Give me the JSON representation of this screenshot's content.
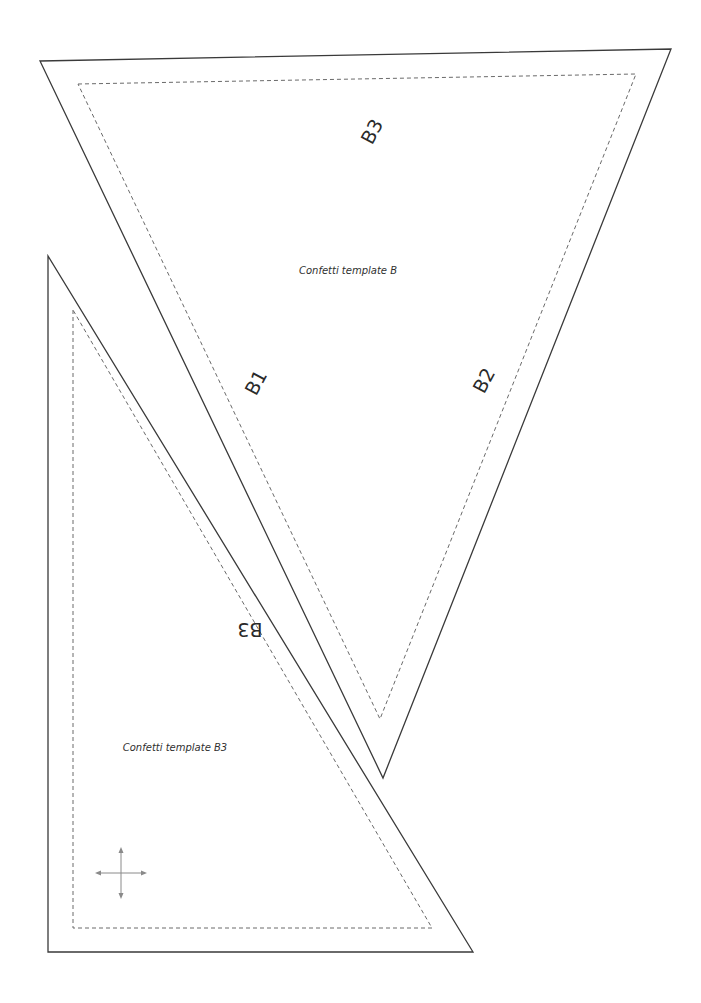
{
  "document": {
    "type": "sewing-template-sheet",
    "colors": {
      "cut_line": "#3a3a3a",
      "seam_line": "#6a6a6a",
      "grainline": "#8a8a8a",
      "text": "#2a2a2a"
    }
  },
  "template_b": {
    "caption": "Confetti template B",
    "edge_labels": {
      "top": "B3",
      "left": "B1",
      "right": "B2"
    }
  },
  "template_b3": {
    "caption": "Confetti template B3",
    "edge_labels": {
      "hypotenuse": "B3"
    },
    "grainline_icon": "four-way-arrow-cross"
  }
}
